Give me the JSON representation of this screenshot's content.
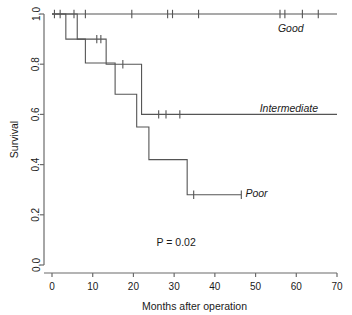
{
  "chart_data": {
    "type": "line",
    "title": "",
    "subtitle": "",
    "xlabel": "Months after operation",
    "ylabel": "Survival",
    "xlim": [
      0,
      70
    ],
    "ylim": [
      0.0,
      1.0
    ],
    "xticks": [
      0,
      10,
      20,
      30,
      40,
      50,
      60,
      70
    ],
    "xtick_labels": [
      "0",
      "10",
      "20",
      "30",
      "40",
      "50",
      "60",
      "70"
    ],
    "yticks": [
      0.0,
      0.2,
      0.4,
      0.6,
      0.8,
      1.0
    ],
    "ytick_labels": [
      "0.0",
      "0.2",
      "0.4",
      "0.6",
      "0.8",
      "1.0"
    ],
    "grid": false,
    "legend_position": "inline-right-of-curves",
    "annotations": [
      {
        "text": "P = 0.02",
        "x": 30.5,
        "y": 0.075
      }
    ],
    "series": [
      {
        "name": "Good",
        "label": "Good",
        "label_x": 55.5,
        "label_y": 0.945,
        "color": "#555555",
        "steps": [
          {
            "x": 0,
            "y": 1.0
          },
          {
            "x": 70,
            "y": 1.0
          }
        ],
        "censor_x": [
          0.6,
          2.0,
          5.4,
          8.2,
          19.6,
          28.4,
          29.6,
          36.0,
          56.0,
          57.2,
          61.5,
          65.4
        ],
        "censor_y": 1.0
      },
      {
        "name": "Intermediate",
        "label": "Intermediate",
        "label_x": 51.0,
        "label_y": 0.625,
        "color": "#555555",
        "steps": [
          {
            "x": 0,
            "y": 1.0
          },
          {
            "x": 3.4,
            "y": 1.0
          },
          {
            "x": 3.4,
            "y": 0.9
          },
          {
            "x": 13.3,
            "y": 0.9
          },
          {
            "x": 13.3,
            "y": 0.8
          },
          {
            "x": 22.0,
            "y": 0.8
          },
          {
            "x": 22.0,
            "y": 0.6
          },
          {
            "x": 70,
            "y": 0.6
          }
        ],
        "censor_x": [
          11.0,
          12.0,
          17.4,
          26.2,
          28.0,
          31.4
        ],
        "censor_points": [
          {
            "x": 11.0,
            "y": 0.9
          },
          {
            "x": 12.0,
            "y": 0.9
          },
          {
            "x": 17.4,
            "y": 0.8
          },
          {
            "x": 26.2,
            "y": 0.6
          },
          {
            "x": 28.0,
            "y": 0.6
          },
          {
            "x": 31.4,
            "y": 0.6
          }
        ]
      },
      {
        "name": "Poor",
        "label": "Poor",
        "label_x": 47.5,
        "label_y": 0.285,
        "color": "#555555",
        "steps": [
          {
            "x": 0,
            "y": 1.0
          },
          {
            "x": 6.2,
            "y": 1.0
          },
          {
            "x": 6.2,
            "y": 0.9
          },
          {
            "x": 8.2,
            "y": 0.9
          },
          {
            "x": 8.2,
            "y": 0.805
          },
          {
            "x": 15.5,
            "y": 0.805
          },
          {
            "x": 15.5,
            "y": 0.68
          },
          {
            "x": 20.8,
            "y": 0.68
          },
          {
            "x": 20.8,
            "y": 0.55
          },
          {
            "x": 23.8,
            "y": 0.55
          },
          {
            "x": 23.8,
            "y": 0.42
          },
          {
            "x": 33.2,
            "y": 0.42
          },
          {
            "x": 33.2,
            "y": 0.28
          },
          {
            "x": 46.5,
            "y": 0.28
          }
        ],
        "censor_points": [
          {
            "x": 34.8,
            "y": 0.28
          },
          {
            "x": 46.5,
            "y": 0.28
          }
        ]
      }
    ]
  },
  "axes": {
    "ylabel": "Survival",
    "xlabel": "Months after operation"
  },
  "colors": {
    "axis": "#6b6b6b",
    "curve": "#555555",
    "text": "#1a1a1a",
    "background": "#ffffff"
  }
}
